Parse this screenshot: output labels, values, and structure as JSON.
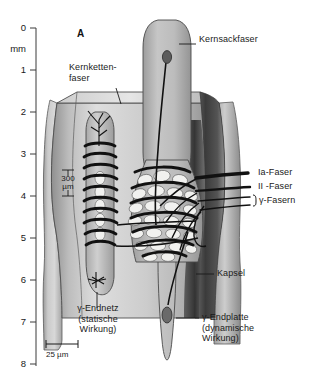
{
  "figure": {
    "panel_letter": "A",
    "axis": {
      "unit_label": "mm",
      "ticks": [
        "0",
        "1",
        "2",
        "3",
        "4",
        "5",
        "6",
        "7",
        "8"
      ]
    },
    "scalebar": {
      "label": "25 µm"
    },
    "inner_scale": {
      "label_line1": "300",
      "label_line2": "µm"
    },
    "labels": {
      "nuclear_chain_fiber": "Kernketten-\nfaser",
      "nuclear_bag_fiber": "Kernsackfaser",
      "capsule": "Kapsel",
      "gamma_endplate": "γ-Endplatte\n(dynamische\nWirkung)",
      "gamma_endnetwork": "γ-Endnetz\n(statische\nWirkung)",
      "afferent_ia": "Ia-Faser",
      "afferent_ii": "II -Faser",
      "efferent_gamma": "γ-Fasern"
    },
    "colors": {
      "ink": "#1a1a1a",
      "capsule_light": "#cfcfcf",
      "capsule_mid": "#a8a8a8",
      "capsule_dark": "#4a4a4a",
      "fiber_fill": "#b9b9b9",
      "nucleus_fill": "#f0f0ee",
      "background": "#ffffff"
    }
  }
}
